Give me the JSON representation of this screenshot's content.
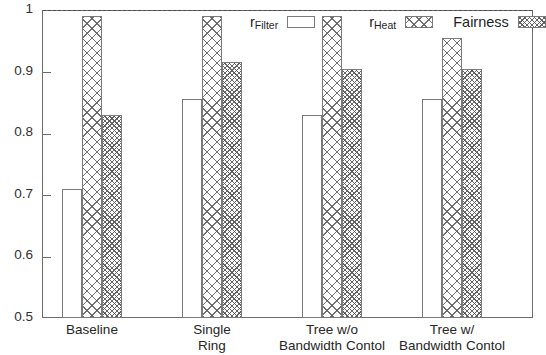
{
  "chart_data": {
    "type": "bar",
    "title": "",
    "xlabel": "",
    "ylabel": "",
    "ylim": [
      0.5,
      1.0
    ],
    "yticks": [
      0.5,
      0.6,
      0.7,
      0.8,
      0.9,
      1.0
    ],
    "ytick_labels": [
      "0.5",
      "0.6",
      "0.7",
      "0.8",
      "0.9",
      "1"
    ],
    "grid": false,
    "reference_line": 1.0,
    "legend_position": "top-right",
    "categories": [
      "Baseline",
      "Single Ring",
      "Tree w/o Bandwidth Contol",
      "Tree w/ Bandwidth Contol"
    ],
    "category_lines": [
      [
        "Baseline"
      ],
      [
        "Single",
        "Ring"
      ],
      [
        "Tree w/o",
        "Bandwidth Contol"
      ],
      [
        "Tree w/",
        "Bandwidth Contol"
      ]
    ],
    "series": [
      {
        "name": "r_Filter",
        "label_main": "r",
        "label_sub": "Filter",
        "pattern": "open",
        "values": [
          0.71,
          0.855,
          0.83,
          0.855
        ]
      },
      {
        "name": "r_Heat",
        "label_main": "r",
        "label_sub": "Heat",
        "pattern": "cross",
        "values": [
          0.99,
          0.99,
          0.99,
          0.955
        ]
      },
      {
        "name": "Fairness",
        "label_main": "Fairness",
        "label_sub": "",
        "pattern": "dense",
        "values": [
          0.83,
          0.915,
          0.905,
          0.905
        ]
      }
    ]
  },
  "legend": {
    "entries": [
      {
        "main": "r",
        "sub": "Filter",
        "swatch": "open"
      },
      {
        "main": "r",
        "sub": "Heat",
        "swatch": "cross"
      },
      {
        "main": "Fairness",
        "sub": "",
        "swatch": "dense"
      }
    ]
  },
  "colors": {
    "frame": "#6b6b6b",
    "bar_outline": "#7a7a7a",
    "hatch": "#5a5a5a",
    "text": "#262626",
    "background": "#ffffff"
  }
}
